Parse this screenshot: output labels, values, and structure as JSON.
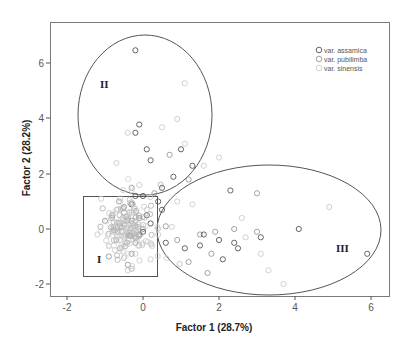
{
  "chart_data": {
    "type": "scatter",
    "title": "",
    "xlabel": "Factor 1 (28.7%)",
    "ylabel": "Factor 2 (28.2%)",
    "xlim": [
      -2.6,
      6.4
    ],
    "ylim": [
      -2.4,
      7.5
    ],
    "xticks": [
      -2,
      0,
      2,
      4,
      6
    ],
    "yticks": [
      -2,
      0,
      2,
      4,
      6
    ],
    "grid": false,
    "legend_position": "top-right",
    "series": [
      {
        "name": "var. assamica",
        "color": "#555555",
        "points": [
          [
            -0.2,
            6.5
          ],
          [
            -0.1,
            3.8
          ],
          [
            -0.2,
            3.5
          ],
          [
            0.1,
            2.9
          ],
          [
            0.2,
            2.5
          ],
          [
            1.0,
            2.9
          ],
          [
            0.8,
            1.9
          ],
          [
            -0.2,
            1.2
          ],
          [
            0.0,
            1.2
          ],
          [
            0.5,
            1.5
          ],
          [
            1.3,
            2.3
          ],
          [
            -0.3,
            0.9
          ],
          [
            0.2,
            0.2
          ],
          [
            0.1,
            0.5
          ],
          [
            0.0,
            -0.1
          ],
          [
            0.4,
            1.0
          ],
          [
            0.5,
            0.7
          ],
          [
            2.3,
            1.4
          ],
          [
            1.6,
            -0.2
          ],
          [
            2.0,
            -0.4
          ],
          [
            2.5,
            -0.7
          ],
          [
            3.1,
            -0.3
          ],
          [
            4.1,
            0.0
          ],
          [
            0.6,
            -0.5
          ],
          [
            1.1,
            -0.7
          ],
          [
            1.5,
            -0.6
          ],
          [
            2.4,
            -0.5
          ],
          [
            2.1,
            -1.1
          ],
          [
            5.9,
            -0.9
          ],
          [
            -0.1,
            -0.2
          ]
        ]
      },
      {
        "name": "var. pubilimba",
        "color": "#999999",
        "points": [
          [
            -0.5,
            0.6
          ],
          [
            -0.3,
            0.3
          ],
          [
            -0.6,
            0.1
          ],
          [
            -0.4,
            -0.2
          ],
          [
            -0.2,
            -0.5
          ],
          [
            -0.7,
            -0.4
          ],
          [
            -0.5,
            0.8
          ],
          [
            -0.1,
            0.4
          ],
          [
            -0.8,
            0.5
          ],
          [
            -0.3,
            -0.9
          ],
          [
            0.0,
            0.0
          ],
          [
            -0.6,
            -0.7
          ],
          [
            -0.2,
            0.1
          ],
          [
            0.6,
            0.1
          ],
          [
            0.9,
            -0.4
          ],
          [
            1.5,
            -0.2
          ],
          [
            2.4,
            0.0
          ],
          [
            1.9,
            -0.1
          ],
          [
            3.0,
            -0.1
          ],
          [
            1.2,
            -1.2
          ],
          [
            1.8,
            -0.9
          ],
          [
            0.3,
            1.3
          ],
          [
            -1.0,
            0.3
          ],
          [
            -0.9,
            -1.0
          ],
          [
            -0.4,
            -1.3
          ],
          [
            1.2,
            1.8
          ],
          [
            -0.3,
            1.5
          ],
          [
            0.7,
            2.7
          ],
          [
            3.0,
            1.3
          ],
          [
            1.7,
            -1.6
          ]
        ]
      },
      {
        "name": "var. sinensis",
        "color": "#cccccc",
        "points": [
          [
            1.1,
            5.3
          ],
          [
            0.9,
            4.0
          ],
          [
            0.5,
            3.7
          ],
          [
            -0.4,
            3.5
          ],
          [
            1.1,
            3.1
          ],
          [
            -1.1,
            1.1
          ],
          [
            -0.7,
            2.4
          ],
          [
            -0.3,
            0.6
          ],
          [
            -0.6,
            0.2
          ],
          [
            -0.4,
            -0.1
          ],
          [
            -0.2,
            0.3
          ],
          [
            -0.5,
            -0.3
          ],
          [
            -0.8,
            -0.1
          ],
          [
            -0.1,
            -0.6
          ],
          [
            -0.3,
            0.9
          ],
          [
            -0.7,
            0.7
          ],
          [
            -0.9,
            -0.6
          ],
          [
            -0.2,
            -0.9
          ],
          [
            -0.6,
            1.0
          ],
          [
            0.1,
            0.7
          ],
          [
            -1.2,
            -0.2
          ],
          [
            -0.4,
            -1.5
          ],
          [
            0.2,
            -1.1
          ],
          [
            0.9,
            1.0
          ],
          [
            2.0,
            2.6
          ],
          [
            3.1,
            -0.9
          ],
          [
            4.9,
            0.8
          ],
          [
            3.3,
            -1.5
          ],
          [
            3.7,
            -2.0
          ],
          [
            2.7,
            -0.3
          ],
          [
            2.6,
            0.4
          ],
          [
            1.3,
            0.9
          ],
          [
            0.4,
            -0.2
          ],
          [
            -0.1,
            1.6
          ],
          [
            1.6,
            2.3
          ]
        ]
      }
    ],
    "annotations": [
      {
        "label": "I",
        "shape": "rectangle",
        "x0": -1.6,
        "x1": 0.37,
        "y0": -1.71,
        "y1": 1.2
      },
      {
        "label": "II",
        "shape": "ellipse",
        "cx": 0.05,
        "cy": 4.15,
        "rx": 1.76,
        "ry": 2.91
      },
      {
        "label": "III",
        "shape": "ellipse",
        "cx": 3.32,
        "cy": -0.04,
        "rx": 2.95,
        "ry": 2.36
      }
    ]
  },
  "legend": {
    "items": [
      {
        "label": "var. assamica",
        "color": "#555555"
      },
      {
        "label": "var. pubilimba",
        "color": "#999999"
      },
      {
        "label": "var. sinensis",
        "color": "#cccccc"
      }
    ]
  },
  "axes": {
    "x_title": "Factor 1 (28.7%)",
    "y_title": "Factor 2 (28.2%)",
    "x_ticks": [
      "-2",
      "0",
      "2",
      "4",
      "6"
    ],
    "y_ticks": [
      "6",
      "4",
      "2",
      "0",
      "-2"
    ]
  },
  "regions": {
    "I": "I",
    "II": "II",
    "III": "III"
  }
}
